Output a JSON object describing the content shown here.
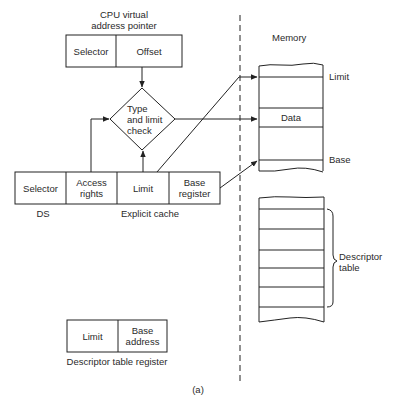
{
  "diagram": {
    "cpu_pointer": {
      "title_line1": "CPU virtual",
      "title_line2": "address pointer",
      "fields": [
        "Selector",
        "Offset"
      ]
    },
    "check": {
      "line1": "Type",
      "line2": "and limit",
      "line3": "check"
    },
    "explicit_cache": {
      "fields": [
        {
          "line1": "Selector",
          "line2": ""
        },
        {
          "line1": "Access",
          "line2": "rights"
        },
        {
          "line1": "Limit",
          "line2": ""
        },
        {
          "line1": "Base",
          "line2": "register"
        }
      ],
      "ds_label": "DS",
      "caption": "Explicit cache"
    },
    "memory": {
      "title": "Memory",
      "segment_labels": {
        "limit": "Limit",
        "data": "Data",
        "base": "Base"
      },
      "descriptor_table_label_line1": "Descriptor",
      "descriptor_table_label_line2": "table"
    },
    "descriptor_table_register": {
      "fields": [
        {
          "line1": "Limit",
          "line2": ""
        },
        {
          "line1": "Base",
          "line2": "address"
        }
      ],
      "caption": "Descriptor table register"
    },
    "figure_label": "(a)"
  }
}
